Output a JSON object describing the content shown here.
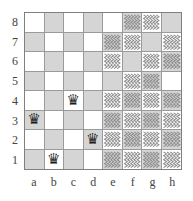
{
  "diagram": {
    "type": "chessboard",
    "title": "",
    "board_size": 8,
    "files": [
      "a",
      "b",
      "c",
      "d",
      "e",
      "f",
      "g",
      "h"
    ],
    "ranks": [
      "8",
      "7",
      "6",
      "5",
      "4",
      "3",
      "2",
      "1"
    ],
    "colors": {
      "light_square": "#ffffff",
      "dark_square": "#d5d5d5",
      "grid_line": "#9a9a9a",
      "border": "#808080",
      "hatch_stroke": "#8a8a8a",
      "piece": "#1a1a1a",
      "label": "#444444"
    },
    "piece_glyph": "♛",
    "piece_name": "black-queen",
    "pieces": [
      {
        "square": "a3",
        "piece": "black-queen",
        "glyph": "♛"
      },
      {
        "square": "b1",
        "piece": "black-queen",
        "glyph": "♛"
      },
      {
        "square": "c4",
        "piece": "black-queen",
        "glyph": "♛"
      },
      {
        "square": "d2",
        "piece": "black-queen",
        "glyph": "♛"
      }
    ],
    "hatched_squares": [
      "f8",
      "g8",
      "e7",
      "f7",
      "h7",
      "e6",
      "g6",
      "h6",
      "f5",
      "g5",
      "e4",
      "f4",
      "g4",
      "h4",
      "e3",
      "f3",
      "g3",
      "h3",
      "e2",
      "f2",
      "g2",
      "h2",
      "e1",
      "f1",
      "g1",
      "h1"
    ],
    "squares": [
      [
        {
          "id": "a8",
          "shade": "light",
          "hatched": false,
          "piece": null
        },
        {
          "id": "b8",
          "shade": "dark",
          "hatched": false,
          "piece": null
        },
        {
          "id": "c8",
          "shade": "light",
          "hatched": false,
          "piece": null
        },
        {
          "id": "d8",
          "shade": "dark",
          "hatched": false,
          "piece": null
        },
        {
          "id": "e8",
          "shade": "light",
          "hatched": false,
          "piece": null
        },
        {
          "id": "f8",
          "shade": "dark",
          "hatched": true,
          "piece": null
        },
        {
          "id": "g8",
          "shade": "light",
          "hatched": true,
          "piece": null
        },
        {
          "id": "h8",
          "shade": "dark",
          "hatched": false,
          "piece": null
        }
      ],
      [
        {
          "id": "a7",
          "shade": "dark",
          "hatched": false,
          "piece": null
        },
        {
          "id": "b7",
          "shade": "light",
          "hatched": false,
          "piece": null
        },
        {
          "id": "c7",
          "shade": "dark",
          "hatched": false,
          "piece": null
        },
        {
          "id": "d7",
          "shade": "light",
          "hatched": false,
          "piece": null
        },
        {
          "id": "e7",
          "shade": "dark",
          "hatched": true,
          "piece": null
        },
        {
          "id": "f7",
          "shade": "light",
          "hatched": true,
          "piece": null
        },
        {
          "id": "g7",
          "shade": "dark",
          "hatched": false,
          "piece": null
        },
        {
          "id": "h7",
          "shade": "light",
          "hatched": true,
          "piece": null
        }
      ],
      [
        {
          "id": "a6",
          "shade": "light",
          "hatched": false,
          "piece": null
        },
        {
          "id": "b6",
          "shade": "dark",
          "hatched": false,
          "piece": null
        },
        {
          "id": "c6",
          "shade": "light",
          "hatched": false,
          "piece": null
        },
        {
          "id": "d6",
          "shade": "dark",
          "hatched": false,
          "piece": null
        },
        {
          "id": "e6",
          "shade": "light",
          "hatched": true,
          "piece": null
        },
        {
          "id": "f6",
          "shade": "dark",
          "hatched": false,
          "piece": null
        },
        {
          "id": "g6",
          "shade": "light",
          "hatched": true,
          "piece": null
        },
        {
          "id": "h6",
          "shade": "dark",
          "hatched": true,
          "piece": null
        }
      ],
      [
        {
          "id": "a5",
          "shade": "dark",
          "hatched": false,
          "piece": null
        },
        {
          "id": "b5",
          "shade": "light",
          "hatched": false,
          "piece": null
        },
        {
          "id": "c5",
          "shade": "dark",
          "hatched": false,
          "piece": null
        },
        {
          "id": "d5",
          "shade": "light",
          "hatched": false,
          "piece": null
        },
        {
          "id": "e5",
          "shade": "dark",
          "hatched": false,
          "piece": null
        },
        {
          "id": "f5",
          "shade": "light",
          "hatched": true,
          "piece": null
        },
        {
          "id": "g5",
          "shade": "dark",
          "hatched": true,
          "piece": null
        },
        {
          "id": "h5",
          "shade": "light",
          "hatched": false,
          "piece": null
        }
      ],
      [
        {
          "id": "a4",
          "shade": "light",
          "hatched": false,
          "piece": null
        },
        {
          "id": "b4",
          "shade": "dark",
          "hatched": false,
          "piece": null
        },
        {
          "id": "c4",
          "shade": "light",
          "hatched": false,
          "piece": "♛"
        },
        {
          "id": "d4",
          "shade": "dark",
          "hatched": false,
          "piece": null
        },
        {
          "id": "e4",
          "shade": "light",
          "hatched": true,
          "piece": null
        },
        {
          "id": "f4",
          "shade": "dark",
          "hatched": true,
          "piece": null
        },
        {
          "id": "g4",
          "shade": "light",
          "hatched": true,
          "piece": null
        },
        {
          "id": "h4",
          "shade": "dark",
          "hatched": true,
          "piece": null
        }
      ],
      [
        {
          "id": "a3",
          "shade": "dark",
          "hatched": false,
          "piece": "♛"
        },
        {
          "id": "b3",
          "shade": "light",
          "hatched": false,
          "piece": null
        },
        {
          "id": "c3",
          "shade": "dark",
          "hatched": false,
          "piece": null
        },
        {
          "id": "d3",
          "shade": "light",
          "hatched": false,
          "piece": null
        },
        {
          "id": "e3",
          "shade": "dark",
          "hatched": true,
          "piece": null
        },
        {
          "id": "f3",
          "shade": "light",
          "hatched": true,
          "piece": null
        },
        {
          "id": "g3",
          "shade": "dark",
          "hatched": true,
          "piece": null
        },
        {
          "id": "h3",
          "shade": "light",
          "hatched": true,
          "piece": null
        }
      ],
      [
        {
          "id": "a2",
          "shade": "light",
          "hatched": false,
          "piece": null
        },
        {
          "id": "b2",
          "shade": "dark",
          "hatched": false,
          "piece": null
        },
        {
          "id": "c2",
          "shade": "light",
          "hatched": false,
          "piece": null
        },
        {
          "id": "d2",
          "shade": "dark",
          "hatched": false,
          "piece": "♛"
        },
        {
          "id": "e2",
          "shade": "light",
          "hatched": true,
          "piece": null
        },
        {
          "id": "f2",
          "shade": "dark",
          "hatched": true,
          "piece": null
        },
        {
          "id": "g2",
          "shade": "light",
          "hatched": true,
          "piece": null
        },
        {
          "id": "h2",
          "shade": "dark",
          "hatched": true,
          "piece": null
        }
      ],
      [
        {
          "id": "a1",
          "shade": "dark",
          "hatched": false,
          "piece": null
        },
        {
          "id": "b1",
          "shade": "light",
          "hatched": false,
          "piece": "♛"
        },
        {
          "id": "c1",
          "shade": "dark",
          "hatched": false,
          "piece": null
        },
        {
          "id": "d1",
          "shade": "light",
          "hatched": false,
          "piece": null
        },
        {
          "id": "e1",
          "shade": "dark",
          "hatched": true,
          "piece": null
        },
        {
          "id": "f1",
          "shade": "light",
          "hatched": true,
          "piece": null
        },
        {
          "id": "g1",
          "shade": "dark",
          "hatched": true,
          "piece": null
        },
        {
          "id": "h1",
          "shade": "light",
          "hatched": true,
          "piece": null
        }
      ]
    ]
  }
}
